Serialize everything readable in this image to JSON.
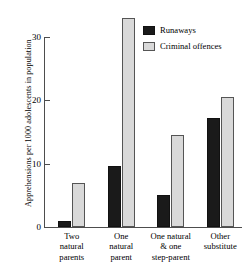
{
  "chart_data": {
    "type": "bar",
    "title": "",
    "xlabel": "",
    "ylabel": "Apprehensions per 1000 adolescents in population",
    "ylim": [
      0,
      33.5
    ],
    "yticks": [
      0,
      10,
      20,
      30
    ],
    "ytick_labels": [
      "0",
      "10",
      "20",
      "30"
    ],
    "grid": false,
    "legend_position": "top-right",
    "categories": [
      "Two\nnatural\nparents",
      "One\nnatural\nparent",
      "One natural\n& one\nstep-parent",
      "Other\nsubstitute"
    ],
    "categories_flat": [
      "Two natural parents",
      "One natural parent",
      "One natural & one step-parent",
      "Other substitute"
    ],
    "series": [
      {
        "name": "Runaways",
        "color": "#1a1a1a",
        "values": [
          1.0,
          9.7,
          5.0,
          17.2
        ]
      },
      {
        "name": "Criminal offences",
        "color": "#d9d9d9",
        "values": [
          7.0,
          33.0,
          14.5,
          20.5
        ]
      }
    ]
  },
  "legend": {
    "items": [
      {
        "label": "Runaways",
        "swatch": "runaways-swatch"
      },
      {
        "label": "Criminal offences",
        "swatch": "criminal-offences-swatch"
      }
    ]
  }
}
